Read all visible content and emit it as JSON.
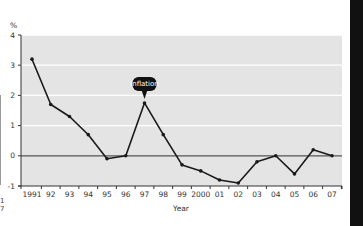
{
  "chart_data": {
    "type": "line",
    "title": "",
    "xlabel": "Year",
    "ylabel": "%",
    "categories": [
      "1991",
      "92",
      "93",
      "94",
      "95",
      "96",
      "97",
      "98",
      "99",
      "2000",
      "01",
      "02",
      "03",
      "04",
      "05",
      "06",
      "07"
    ],
    "series": [
      {
        "name": "inflation",
        "values": [
          3.2,
          1.7,
          1.3,
          0.7,
          -0.1,
          0.0,
          1.75,
          0.7,
          -0.3,
          -0.5,
          -0.8,
          -0.9,
          -0.2,
          0.0,
          -0.6,
          0.2,
          0.0
        ]
      }
    ],
    "yticks": [
      4,
      3,
      2,
      1,
      0,
      -1
    ],
    "ylim": [
      -1,
      4
    ],
    "grid": true,
    "annotations": [
      {
        "text": "inflation",
        "category": "97"
      }
    ],
    "colors": {
      "plot_background": "#e4e4e4",
      "gridline": "#ffffff",
      "line": "#1a1a1a",
      "zero_line": "#555555",
      "annotation_bg": "#111111",
      "annotation_text": "#ffffff"
    }
  },
  "left_edge_text": [
    "1",
    "7"
  ]
}
